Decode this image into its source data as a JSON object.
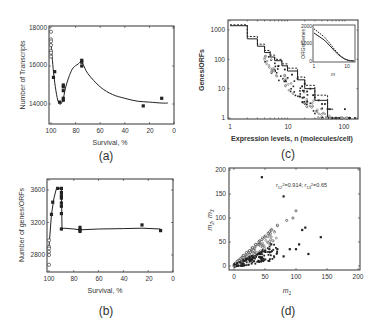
{
  "figure": {
    "panels": {
      "a": {
        "label": "(a)",
        "xlabel": "Survival, %",
        "ylabel": "Number of Transcripts",
        "xticks": [
          "100",
          "80",
          "60",
          "40",
          "20",
          "0"
        ],
        "yticks": [
          "18000",
          "16000",
          "14000"
        ]
      },
      "b": {
        "label": "(b)",
        "xlabel": "Survival, %",
        "ylabel": "Number of genes/ORFs",
        "xticks": [
          "100",
          "80",
          "60",
          "40",
          "20",
          "0"
        ],
        "yticks": [
          "3600",
          "3200",
          "2800"
        ]
      },
      "c": {
        "label": "(c)",
        "xlabel": "Expression levels, n (molecules/cell)",
        "ylabel": "Genes/ORFs",
        "xticks": [
          "1",
          "10",
          "100"
        ],
        "yticks": [
          "1000",
          "100",
          "10",
          "1"
        ],
        "inset": {
          "ylabel": "ORGs/Genes",
          "xlabel": "m",
          "yticks": [
            "2000",
            "1000",
            "0"
          ],
          "xticks": [
            "1",
            "10"
          ]
        }
      },
      "d": {
        "label": "(d)",
        "xlabel": "m1",
        "ylabel": "m2, m3",
        "xticks": [
          "0",
          "50",
          "100",
          "150",
          "200"
        ],
        "yticks": [
          "200",
          "150",
          "100",
          "50",
          "0"
        ],
        "annotation": "r12²=0.914; r13²=0.65"
      }
    }
  },
  "chart_data": [
    {
      "id": "a",
      "type": "scatter",
      "title": "",
      "xlabel": "Survival, %",
      "ylabel": "Number of Transcripts",
      "xlim": [
        100,
        0
      ],
      "ylim": [
        13000,
        18000
      ],
      "grid": false,
      "series": [
        {
          "name": "open",
          "marker": "open-circle",
          "x": [
            100,
            100,
            100,
            100,
            100,
            100,
            100
          ],
          "y": [
            17800,
            17400,
            17300,
            17100,
            16800,
            16700,
            16500
          ]
        },
        {
          "name": "filled",
          "marker": "filled-square",
          "x": [
            98,
            97,
            93,
            90,
            90,
            90,
            90,
            90,
            75,
            75,
            75,
            25,
            10
          ],
          "y": [
            15400,
            15700,
            14100,
            15000,
            14900,
            14700,
            14300,
            14200,
            16300,
            16200,
            16000,
            13900,
            14300
          ]
        },
        {
          "name": "fit",
          "type": "line",
          "x": [
            100,
            98,
            96,
            94,
            92,
            90,
            88,
            85,
            82,
            78,
            75,
            70,
            60,
            50,
            40,
            30,
            20,
            10,
            5
          ],
          "y": [
            17200,
            15700,
            14700,
            14100,
            14000,
            14300,
            14900,
            15500,
            15900,
            16100,
            16200,
            15600,
            14900,
            14500,
            14300,
            14150,
            14100,
            14050,
            14050
          ]
        }
      ]
    },
    {
      "id": "b",
      "type": "scatter",
      "title": "",
      "xlabel": "Survival, %",
      "ylabel": "Number of genes/ORFs",
      "xlim": [
        100,
        0
      ],
      "ylim": [
        2600,
        3800
      ],
      "grid": false,
      "series": [
        {
          "name": "open",
          "marker": "open-circle",
          "x": [
            100,
            100,
            100,
            100,
            100,
            100
          ],
          "y": [
            2980,
            2900,
            2880,
            2840,
            2800,
            2680
          ]
        },
        {
          "name": "filled",
          "marker": "filled-square",
          "x": [
            98,
            97,
            93,
            90,
            90,
            90,
            90,
            90,
            90,
            90,
            90,
            75,
            75,
            75,
            25,
            10
          ],
          "y": [
            3300,
            3450,
            3620,
            3620,
            3570,
            3530,
            3500,
            3440,
            3400,
            3310,
            3120,
            3140,
            3110,
            3090,
            3170,
            3100
          ]
        },
        {
          "name": "fit",
          "type": "line",
          "x": [
            100,
            98,
            96,
            94,
            92,
            90,
            89.5,
            88,
            80,
            75,
            60,
            40,
            25,
            10
          ],
          "y": [
            2900,
            3300,
            3500,
            3620,
            3620,
            3620,
            3120,
            3130,
            3120,
            3110,
            3120,
            3125,
            3130,
            3120
          ]
        }
      ]
    },
    {
      "id": "c",
      "type": "scatter",
      "title": "",
      "xlabel": "Expression levels, n (molecules/cell)",
      "ylabel": "Genes/ORFs",
      "xscale": "log",
      "yscale": "log",
      "xlim": [
        1,
        150
      ],
      "ylim": [
        1,
        1500
      ],
      "grid": false,
      "series": [
        {
          "name": "step-solid",
          "type": "step",
          "x": [
            1,
            2,
            3,
            4,
            5,
            6,
            8,
            10,
            15,
            20,
            30,
            50,
            70
          ],
          "y": [
            1400,
            500,
            280,
            170,
            120,
            90,
            60,
            40,
            20,
            10,
            4,
            1,
            1
          ]
        },
        {
          "name": "step-dashed",
          "type": "step",
          "x": [
            1,
            2,
            3,
            4,
            5,
            6,
            8,
            10,
            15,
            20,
            30,
            50
          ],
          "y": [
            1500,
            600,
            330,
            200,
            140,
            100,
            70,
            50,
            25,
            13,
            6,
            2
          ]
        },
        {
          "name": "data",
          "marker": "mixed",
          "x": [
            7,
            9,
            12,
            15,
            18,
            20,
            22,
            25,
            28,
            30,
            35,
            40,
            45,
            50,
            55,
            60,
            70,
            80,
            100,
            120,
            150
          ],
          "y": [
            60,
            45,
            30,
            22,
            12,
            15,
            8,
            10,
            6,
            5,
            4,
            3,
            3,
            2,
            2,
            1,
            1,
            1,
            2,
            1,
            1
          ]
        }
      ],
      "inset": {
        "type": "line",
        "xlabel": "m",
        "ylabel": "ORGs/Genes",
        "xlim": [
          1,
          15
        ],
        "ylim": [
          0,
          2000
        ],
        "x": [
          1,
          2,
          3,
          4,
          5,
          6,
          8,
          10,
          12,
          15
        ],
        "y": [
          1600,
          1200,
          850,
          580,
          400,
          260,
          110,
          40,
          15,
          5
        ]
      }
    },
    {
      "id": "d",
      "type": "scatter",
      "title": "",
      "xlabel": "m1",
      "ylabel": "m2, m3",
      "xlim": [
        0,
        200
      ],
      "ylim": [
        0,
        200
      ],
      "grid": false,
      "annotation": "r12²=0.914; r13²=0.65",
      "series": [
        {
          "name": "m2",
          "marker": "open-circle",
          "x": [
            5,
            10,
            15,
            20,
            25,
            30,
            35,
            40,
            45,
            50,
            55,
            60,
            70,
            85,
            95,
            100
          ],
          "y": [
            10,
            15,
            22,
            28,
            32,
            38,
            45,
            50,
            55,
            60,
            68,
            75,
            85,
            95,
            100,
            115
          ]
        },
        {
          "name": "m3",
          "marker": "filled-square",
          "x": [
            5,
            10,
            15,
            20,
            25,
            30,
            40,
            50,
            60,
            70,
            80,
            90,
            100,
            105,
            110,
            115,
            120,
            140,
            45,
            80
          ],
          "y": [
            5,
            8,
            12,
            15,
            18,
            20,
            25,
            30,
            45,
            35,
            20,
            35,
            35,
            45,
            75,
            80,
            25,
            60,
            185,
            145
          ]
        }
      ]
    }
  ]
}
